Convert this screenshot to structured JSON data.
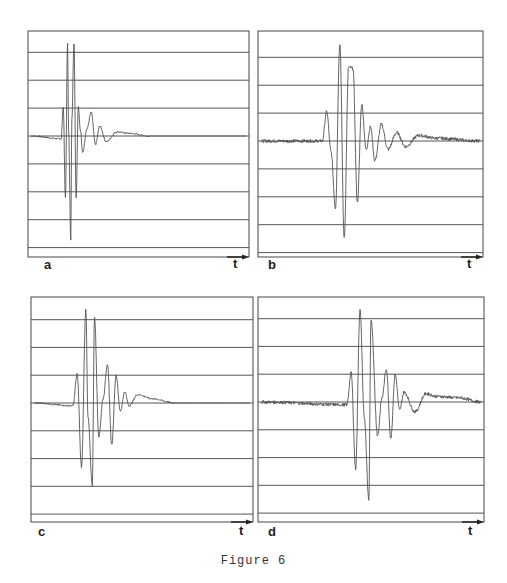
{
  "figure": {
    "caption": "Figure 6",
    "colors": {
      "frame": "#444444",
      "gridline": "#555555",
      "trace": "#555555",
      "background": "#ffffff"
    }
  },
  "chart_data": [
    {
      "type": "line",
      "panel": "a",
      "title": "",
      "xlabel": "t",
      "ylabel": "",
      "grid": "horizontal lines only",
      "x_axis_arrow": true,
      "description": "Short damped oscillatory pulse; two dominant large positive peaks then rapid decay, ringing ends about 2/3 across",
      "x": [
        0,
        0.14,
        0.15,
        0.16,
        0.17,
        0.175,
        0.185,
        0.19,
        0.2,
        0.21,
        0.22,
        0.23,
        0.24,
        0.26,
        0.28,
        0.3,
        0.32,
        0.35,
        0.4,
        0.45,
        0.55,
        1.0
      ],
      "values": [
        0,
        -0.1,
        1.05,
        -2.2,
        3.3,
        0.2,
        -3.75,
        0.6,
        3.3,
        -2.2,
        1.05,
        0.2,
        -0.6,
        0.25,
        0.85,
        -0.3,
        0.35,
        -0.2,
        0.15,
        0.1,
        0,
        0
      ],
      "ylim": [
        -4.2,
        4.2
      ],
      "gridlines_y": [
        -4,
        -3,
        -2,
        -1,
        0,
        1,
        2,
        3
      ]
    },
    {
      "type": "line",
      "panel": "b",
      "title": "",
      "xlabel": "t",
      "ylabel": "",
      "grid": "horizontal lines only",
      "x_axis_arrow": true,
      "description": "Noisy baseline; pulse with tallest first peak, second peak slightly lower, longer noisy coda extending to end",
      "x": [
        0,
        0.28,
        0.3,
        0.32,
        0.34,
        0.36,
        0.38,
        0.4,
        0.42,
        0.44,
        0.46,
        0.48,
        0.5,
        0.52,
        0.55,
        0.58,
        0.62,
        0.66,
        0.72,
        0.8,
        1.0
      ],
      "values": [
        0,
        0,
        1.05,
        -0.4,
        -2.4,
        3.5,
        -3.5,
        2.65,
        2.6,
        -2.2,
        1.3,
        -0.3,
        0.5,
        -0.7,
        0.6,
        -0.3,
        0.3,
        -0.2,
        0.2,
        0.1,
        0
      ],
      "ylim": [
        -4.2,
        4.2
      ],
      "gridlines_y": [
        -4,
        -3,
        -2,
        -1,
        0,
        1,
        2,
        3
      ]
    },
    {
      "type": "line",
      "panel": "c",
      "title": "",
      "xlabel": "t",
      "ylabel": "",
      "grid": "horizontal lines only",
      "x_axis_arrow": true,
      "description": "Pulse with two large peaks followed by secondary wavelet (two moderate peaks), then decaying ringing",
      "x": [
        0,
        0.18,
        0.2,
        0.22,
        0.24,
        0.25,
        0.27,
        0.28,
        0.3,
        0.32,
        0.34,
        0.36,
        0.38,
        0.4,
        0.42,
        0.44,
        0.48,
        0.55,
        0.65,
        1.0
      ],
      "values": [
        0,
        -0.1,
        1.05,
        -2.3,
        3.35,
        -0.5,
        -2.95,
        3.1,
        -1.2,
        0.15,
        1.4,
        -1.5,
        1.0,
        -0.3,
        0.4,
        -0.1,
        0.3,
        0.15,
        0,
        0
      ],
      "ylim": [
        -4.2,
        4.2
      ],
      "gridlines_y": [
        -4,
        -3,
        -2,
        -1,
        0,
        1,
        2,
        3
      ]
    },
    {
      "type": "line",
      "panel": "d",
      "title": "",
      "xlabel": "t",
      "ylabel": "",
      "grid": "horizontal lines only",
      "x_axis_arrow": true,
      "description": "Same waveform shape as c but delayed in time, with slightly noisier coda continuing to end",
      "x": [
        0,
        0.39,
        0.41,
        0.43,
        0.45,
        0.47,
        0.49,
        0.5,
        0.53,
        0.55,
        0.57,
        0.59,
        0.61,
        0.63,
        0.65,
        0.7,
        0.75,
        0.8,
        0.9,
        1.0
      ],
      "values": [
        0,
        -0.1,
        1.05,
        -2.4,
        3.3,
        -0.6,
        -3.55,
        3.0,
        -1.2,
        0.15,
        1.2,
        -1.3,
        1.0,
        -0.3,
        0.35,
        -0.35,
        0.3,
        0.2,
        0.15,
        0
      ],
      "ylim": [
        -4.2,
        4.2
      ],
      "gridlines_y": [
        -4,
        -3,
        -2,
        -1,
        0,
        1,
        2,
        3
      ]
    }
  ],
  "panels": [
    {
      "label": "a",
      "axis_label": "t",
      "x0": 28,
      "x1": 249,
      "y0": 31,
      "ybase": 257,
      "mid": 136
    },
    {
      "label": "b",
      "axis_label": "t",
      "x0": 258,
      "x1": 483,
      "y0": 31,
      "ybase": 257,
      "mid": 141
    },
    {
      "label": "c",
      "axis_label": "t",
      "x0": 31,
      "x1": 253,
      "y0": 297,
      "ybase": 522,
      "mid": 403
    },
    {
      "label": "d",
      "axis_label": "t",
      "x0": 258,
      "x1": 484,
      "y0": 297,
      "ybase": 522,
      "mid": 402
    }
  ]
}
